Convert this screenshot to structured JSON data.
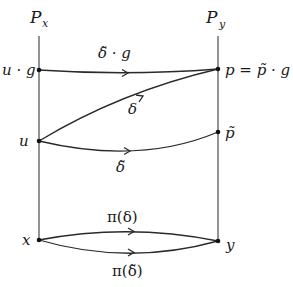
{
  "diagram": {
    "fibers": [
      {
        "id": "Px",
        "label": "P",
        "subscript": "x",
        "x": 39
      },
      {
        "id": "Py",
        "label": "P",
        "subscript": "y",
        "x": 218
      }
    ],
    "points": [
      {
        "id": "ug",
        "label": "u · g",
        "fiber": "Px",
        "x": 39,
        "y": 70
      },
      {
        "id": "p",
        "label": "p = p̃ · g",
        "fiber": "Py",
        "x": 218,
        "y": 69
      },
      {
        "id": "u",
        "label": "u",
        "fiber": "Px",
        "x": 39,
        "y": 141
      },
      {
        "id": "ptilde",
        "label": "p̃",
        "fiber": "Py",
        "x": 218,
        "y": 132
      },
      {
        "id": "x",
        "label": "x",
        "fiber": "base",
        "x": 39,
        "y": 240
      },
      {
        "id": "y",
        "label": "y",
        "fiber": "base",
        "x": 218,
        "y": 241
      }
    ],
    "curves": [
      {
        "id": "delta-tilde-g",
        "from": "ug",
        "to": "p",
        "label": "δ̃ · g"
      },
      {
        "id": "delta",
        "from": "u",
        "to": "p",
        "label": "δ"
      },
      {
        "id": "delta-tilde",
        "from": "u",
        "to": "ptilde",
        "label": "δ̃"
      },
      {
        "id": "pi-delta",
        "from": "x",
        "to": "y",
        "label": "π(δ)"
      },
      {
        "id": "pi-delta-tilde",
        "from": "x",
        "to": "y",
        "label": "π(δ̃)"
      }
    ],
    "labels": {
      "Px_main": "P",
      "Px_sub": "x",
      "Py_main": "P",
      "Py_sub": "y",
      "ug": "u · g",
      "p_eq": "p = p̃ · g",
      "u": "u",
      "ptilde": "p̃",
      "x": "x",
      "y": "y",
      "delta_tilde_g": "δ̃ · g",
      "delta": "δ",
      "delta_tilde": "δ̃",
      "pi_delta": "π(δ)",
      "pi_delta_tilde": "π(δ̃)"
    }
  }
}
